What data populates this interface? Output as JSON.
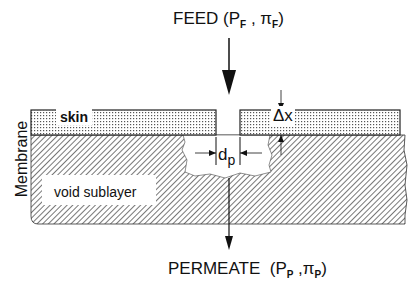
{
  "diagram": {
    "feed": {
      "label": "FEED",
      "pressure_symbol": "P",
      "pressure_sub": "F",
      "osmotic_symbol": "π",
      "osmotic_sub": "F"
    },
    "permeate": {
      "label": "PERMEATE",
      "pressure_symbol": "P",
      "pressure_sub": "P",
      "osmotic_symbol": "π",
      "osmotic_sub": "P"
    },
    "membrane_label": "Membrane",
    "layers": {
      "skin": "skin",
      "sublayer": "void sublayer"
    },
    "dimensions": {
      "thickness": "Δx",
      "pore_diameter_symbol": "d",
      "pore_diameter_sub": "p"
    },
    "colors": {
      "ink": "#111111",
      "hatch": "#555555",
      "dots": "#666666",
      "background": "#ffffff"
    }
  }
}
